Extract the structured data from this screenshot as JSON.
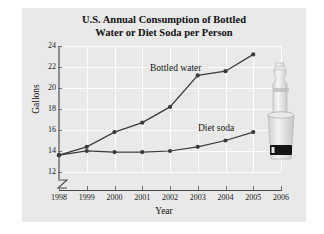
{
  "figure": {
    "title_line1": "U.S. Annual Consumption of Bottled",
    "title_line2": "Water or Diet Soda per Person",
    "photo_alt": "bottled-water-and-soda-cup-photo"
  },
  "chart_data": {
    "type": "line",
    "title": "U.S. Annual Consumption of Bottled Water or Diet Soda per Person",
    "xlabel": "Year",
    "ylabel": "Gallons",
    "categories": [
      1998,
      1999,
      2000,
      2001,
      2002,
      2003,
      2004,
      2005,
      2006
    ],
    "x_tick_labels": [
      "1998",
      "1999",
      "2000",
      "2001",
      "2002",
      "2003",
      "2004",
      "2005",
      "2006"
    ],
    "y_tick_labels": [
      "12",
      "14",
      "16",
      "18",
      "20",
      "22",
      "24"
    ],
    "y_ticks": [
      12,
      14,
      16,
      18,
      20,
      22,
      24
    ],
    "xlim": [
      1998,
      2006
    ],
    "ylim": [
      12,
      24
    ],
    "y_axis_break": true,
    "grid": true,
    "legend": "inline-labels",
    "series": [
      {
        "name": "Bottled water",
        "color": "#3a3a3a",
        "x": [
          1998,
          1999,
          2000,
          2001,
          2002,
          2003,
          2004,
          2005
        ],
        "values": [
          13.6,
          14.4,
          15.8,
          16.7,
          18.2,
          21.2,
          21.6,
          23.2
        ]
      },
      {
        "name": "Diet soda",
        "color": "#3a3a3a",
        "x": [
          1998,
          1999,
          2000,
          2001,
          2002,
          2003,
          2004,
          2005
        ],
        "values": [
          13.6,
          14.0,
          13.9,
          13.9,
          14.0,
          14.4,
          15.0,
          15.8
        ]
      }
    ]
  }
}
